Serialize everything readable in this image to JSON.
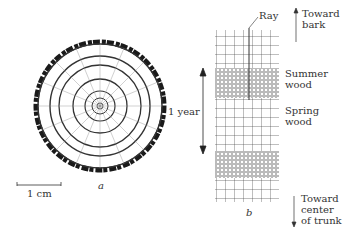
{
  "figure": {
    "panel_a": {
      "label": "a",
      "scale_bar": "1 cm",
      "description": "Cross section of tree trunk showing annual growth rings"
    },
    "panel_b": {
      "label": "b",
      "ray_label": "Ray",
      "year_label": "1 year",
      "summer_wood": [
        "Summer",
        "wood"
      ],
      "spring_wood": [
        "Spring",
        "wood"
      ],
      "toward_bark": [
        "Toward",
        "bark"
      ],
      "toward_center": [
        "Toward",
        "center",
        "of trunk"
      ]
    }
  },
  "colors": {
    "ink": "#222222",
    "bark": "#1a1a1a",
    "background": "#ffffff"
  }
}
